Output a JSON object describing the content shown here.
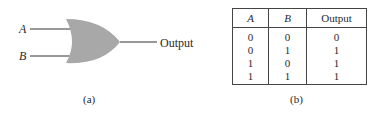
{
  "diagram_a": {
    "caption": "(a)",
    "gate_type": "OR gate",
    "inputs": [
      {
        "label": "A"
      },
      {
        "label": "B"
      }
    ],
    "output_label": "Output",
    "gate_fill": "#a8a8a8"
  },
  "diagram_b": {
    "caption": "(b)",
    "truth_table": {
      "headers": [
        "A",
        "B",
        "Output"
      ],
      "rows": [
        [
          "0",
          "0",
          "0"
        ],
        [
          "0",
          "1",
          "1"
        ],
        [
          "1",
          "0",
          "1"
        ],
        [
          "1",
          "1",
          "1"
        ]
      ]
    }
  }
}
